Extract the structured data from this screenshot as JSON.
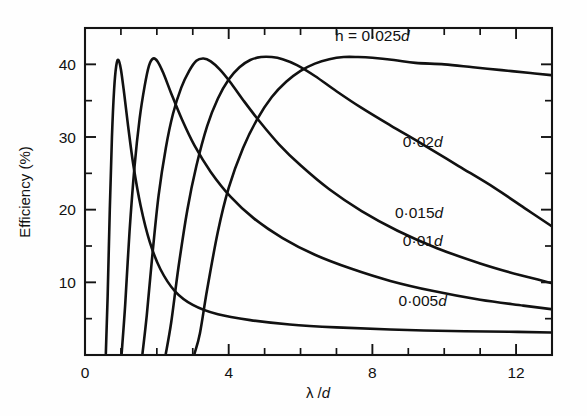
{
  "chart_data": {
    "type": "line",
    "title": "",
    "xlabel": "λ /d",
    "ylabel": "Efficiency (%)",
    "xlim": [
      0,
      13
    ],
    "ylim": [
      0,
      45
    ],
    "grid": false,
    "legend_position": "inline-annotations",
    "x_ticks_major": [
      0,
      4,
      8,
      12
    ],
    "x_ticks_minor": [
      1,
      2,
      3,
      5,
      6,
      7,
      9,
      10,
      11,
      13
    ],
    "x_tick_labels": [
      "0",
      "4",
      "8",
      "12"
    ],
    "y_ticks_major": [
      10,
      20,
      30,
      40
    ],
    "y_ticks_minor": [
      5,
      15,
      25,
      35
    ],
    "y_tick_labels": [
      "10",
      "20",
      "30",
      "40"
    ],
    "series": [
      {
        "name": "h = 0·025d",
        "label": "h = 0·025d",
        "label_x": 8.0,
        "label_y": 43.2,
        "peak_x": 7.4,
        "peak_y": 41.0,
        "points": [
          [
            3.05,
            0.2
          ],
          [
            3.2,
            3.0
          ],
          [
            3.4,
            9.0
          ],
          [
            3.7,
            17.0
          ],
          [
            4.0,
            23.0
          ],
          [
            4.4,
            28.5
          ],
          [
            4.8,
            32.5
          ],
          [
            5.2,
            35.5
          ],
          [
            5.6,
            37.6
          ],
          [
            6.0,
            39.1
          ],
          [
            6.4,
            40.1
          ],
          [
            6.8,
            40.7
          ],
          [
            7.2,
            41.0
          ],
          [
            7.6,
            41.0
          ],
          [
            8.0,
            40.9
          ],
          [
            8.6,
            40.6
          ],
          [
            9.2,
            40.2
          ],
          [
            10.0,
            40.0
          ],
          [
            10.8,
            39.6
          ],
          [
            11.6,
            39.2
          ],
          [
            12.4,
            38.8
          ],
          [
            13.0,
            38.5
          ]
        ]
      },
      {
        "name": "0·02d",
        "label": "0·02d",
        "label_x": 9.4,
        "label_y": 28.6,
        "peak_x": 5.05,
        "peak_y": 41.0,
        "points": [
          [
            2.25,
            0.2
          ],
          [
            2.4,
            4.5
          ],
          [
            2.6,
            12.0
          ],
          [
            2.85,
            20.0
          ],
          [
            3.1,
            26.0
          ],
          [
            3.4,
            31.5
          ],
          [
            3.7,
            35.3
          ],
          [
            4.0,
            37.9
          ],
          [
            4.3,
            39.6
          ],
          [
            4.6,
            40.6
          ],
          [
            4.9,
            41.0
          ],
          [
            5.2,
            41.0
          ],
          [
            5.5,
            40.7
          ],
          [
            5.9,
            39.9
          ],
          [
            6.4,
            38.4
          ],
          [
            7.0,
            36.3
          ],
          [
            7.7,
            34.0
          ],
          [
            8.5,
            31.6
          ],
          [
            9.4,
            29.0
          ],
          [
            10.4,
            26.0
          ],
          [
            11.4,
            23.0
          ],
          [
            12.3,
            20.0
          ],
          [
            13.0,
            17.7
          ]
        ]
      },
      {
        "name": "0·015d",
        "label": "0·015d",
        "label_x": 9.3,
        "label_y": 18.8,
        "peak_x": 3.2,
        "peak_y": 40.8,
        "points": [
          [
            1.6,
            0.2
          ],
          [
            1.72,
            5.5
          ],
          [
            1.88,
            14.0
          ],
          [
            2.05,
            22.0
          ],
          [
            2.25,
            28.5
          ],
          [
            2.45,
            33.2
          ],
          [
            2.68,
            36.8
          ],
          [
            2.9,
            39.1
          ],
          [
            3.1,
            40.5
          ],
          [
            3.3,
            40.8
          ],
          [
            3.5,
            40.4
          ],
          [
            3.75,
            39.3
          ],
          [
            4.05,
            37.5
          ],
          [
            4.4,
            35.1
          ],
          [
            4.85,
            32.2
          ],
          [
            5.4,
            29.0
          ],
          [
            6.0,
            26.1
          ],
          [
            6.8,
            22.8
          ],
          [
            7.7,
            19.8
          ],
          [
            8.7,
            17.1
          ],
          [
            9.8,
            14.7
          ],
          [
            11.0,
            12.6
          ],
          [
            12.1,
            11.0
          ],
          [
            13.0,
            9.9
          ]
        ]
      },
      {
        "name": "0·01d",
        "label": "0·01d",
        "label_x": 9.4,
        "label_y": 15.0,
        "peak_x": 1.82,
        "peak_y": 40.8,
        "points": [
          [
            1.02,
            0.2
          ],
          [
            1.12,
            7.0
          ],
          [
            1.24,
            17.0
          ],
          [
            1.38,
            26.0
          ],
          [
            1.52,
            32.5
          ],
          [
            1.66,
            37.0
          ],
          [
            1.78,
            39.8
          ],
          [
            1.9,
            40.8
          ],
          [
            2.02,
            40.4
          ],
          [
            2.18,
            38.8
          ],
          [
            2.4,
            36.0
          ],
          [
            2.7,
            32.4
          ],
          [
            3.05,
            28.8
          ],
          [
            3.5,
            25.2
          ],
          [
            4.05,
            21.8
          ],
          [
            4.7,
            18.8
          ],
          [
            5.5,
            16.1
          ],
          [
            6.4,
            13.8
          ],
          [
            7.4,
            11.9
          ],
          [
            8.5,
            10.2
          ],
          [
            9.7,
            8.8
          ],
          [
            11.0,
            7.6
          ],
          [
            12.2,
            6.8
          ],
          [
            13.0,
            6.3
          ]
        ]
      },
      {
        "name": "0·005d",
        "label": "0·005d",
        "label_x": 9.4,
        "label_y": 6.8,
        "peak_x": 0.9,
        "peak_y": 40.6,
        "points": [
          [
            0.58,
            0.2
          ],
          [
            0.63,
            8.0
          ],
          [
            0.69,
            20.0
          ],
          [
            0.75,
            30.0
          ],
          [
            0.81,
            36.5
          ],
          [
            0.87,
            39.8
          ],
          [
            0.93,
            40.6
          ],
          [
            1.0,
            39.3
          ],
          [
            1.09,
            36.0
          ],
          [
            1.2,
            31.5
          ],
          [
            1.35,
            26.0
          ],
          [
            1.55,
            20.5
          ],
          [
            1.8,
            15.6
          ],
          [
            2.1,
            11.8
          ],
          [
            2.5,
            8.8
          ],
          [
            3.0,
            6.9
          ],
          [
            3.7,
            5.6
          ],
          [
            4.6,
            4.8
          ],
          [
            5.7,
            4.2
          ],
          [
            7.0,
            3.8
          ],
          [
            8.5,
            3.5
          ],
          [
            10.2,
            3.3
          ],
          [
            11.8,
            3.2
          ],
          [
            13.0,
            3.1
          ]
        ]
      }
    ]
  }
}
